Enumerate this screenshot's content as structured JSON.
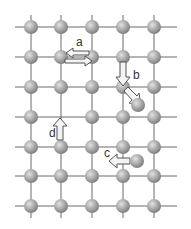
{
  "diagram": {
    "colors": {
      "background": "#ffffff",
      "grid_line": "#6a6a6a",
      "atom_fill": "#a8a8a8",
      "atom_highlight": "#d9d9d9",
      "atom_shadow": "#7a7a7a",
      "arrow_fill": "#f4f4f4",
      "arrow_stroke": "#555555",
      "label": "#333333"
    },
    "lattice": {
      "columns_x": [
        31,
        61,
        92,
        123,
        154
      ],
      "rows_y": [
        27,
        57,
        87,
        117,
        147,
        176,
        206
      ],
      "vacancies": [
        {
          "col": 1,
          "row": 3
        }
      ],
      "atom_radius": 7
    },
    "adatoms": [
      {
        "id": "adatom-b",
        "x": 138,
        "y": 105
      },
      {
        "id": "adatom-c",
        "x": 137,
        "y": 161
      }
    ],
    "labels": [
      {
        "id": "a",
        "text": "a",
        "x": 76,
        "y": 46
      },
      {
        "id": "b",
        "text": "b",
        "x": 133,
        "y": 79
      },
      {
        "id": "c",
        "text": "c",
        "x": 104,
        "y": 157
      },
      {
        "id": "d",
        "text": "d",
        "x": 49,
        "y": 137
      }
    ],
    "mechanisms": [
      {
        "label": "a",
        "description": "exchange between neighboring lattice atoms (two opposite arrows)"
      },
      {
        "label": "b",
        "description": "atom moves down then exchanges diagonally, pushing out an adatom"
      },
      {
        "label": "c",
        "description": "adatom hops left across the surface"
      },
      {
        "label": "d",
        "description": "atom jumps upward into a vacancy"
      }
    ]
  }
}
